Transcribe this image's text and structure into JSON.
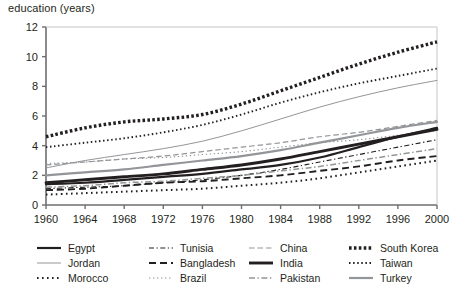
{
  "axis": {
    "ylabel": "education (years)",
    "yticks": [
      "0",
      "2",
      "4",
      "6",
      "8",
      "10",
      "12"
    ],
    "xticks": [
      "1960",
      "1964",
      "1968",
      "1972",
      "1976",
      "1980",
      "1984",
      "1988",
      "1992",
      "1996",
      "2000"
    ]
  },
  "legend": {
    "columns": [
      [
        {
          "name": "Egypt",
          "style": "solid-bold",
          "color": "#231f20"
        },
        {
          "name": "Jordan",
          "style": "solid-thin",
          "color": "#808285"
        },
        {
          "name": "Morocco",
          "style": "dotted-bold",
          "color": "#231f20"
        }
      ],
      [
        {
          "name": "Tunisia",
          "style": "dash-dot-thin",
          "color": "#231f20"
        },
        {
          "name": "Bangladesh",
          "style": "dashed-bold",
          "color": "#231f20"
        },
        {
          "name": "Brazil",
          "style": "dotted-thin",
          "color": "#808285"
        }
      ],
      [
        {
          "name": "China",
          "style": "dashed-thin",
          "color": "#808285"
        },
        {
          "name": "India",
          "style": "solid-extrabold",
          "color": "#231f20"
        },
        {
          "name": "Pakistan",
          "style": "dash-dot-grey",
          "color": "#808285"
        }
      ],
      [
        {
          "name": "South Korea",
          "style": "dotted-extrabold",
          "color": "#231f20"
        },
        {
          "name": "Taiwan",
          "style": "dotted-small",
          "color": "#231f20"
        },
        {
          "name": "Turkey",
          "style": "solid-grey-bold",
          "color": "#808285"
        }
      ]
    ]
  },
  "chart_data": {
    "type": "line",
    "title": "",
    "xlabel": "",
    "ylabel": "education (years)",
    "xlim": [
      1960,
      2000
    ],
    "ylim": [
      0,
      12
    ],
    "grid": false,
    "legend_position": "bottom",
    "x": [
      1960,
      1964,
      1968,
      1972,
      1976,
      1980,
      1984,
      1988,
      1992,
      1996,
      2000
    ],
    "series": [
      {
        "name": "Egypt",
        "values": [
          1.4,
          1.5,
          1.7,
          1.9,
          2.1,
          2.4,
          2.7,
          3.2,
          3.9,
          4.6,
          5.2
        ]
      },
      {
        "name": "Jordan",
        "values": [
          2.5,
          3.0,
          3.4,
          3.8,
          4.3,
          5.0,
          5.8,
          6.6,
          7.3,
          7.9,
          8.4
        ]
      },
      {
        "name": "Morocco",
        "values": [
          0.7,
          0.8,
          0.9,
          1.0,
          1.1,
          1.3,
          1.5,
          1.8,
          2.2,
          2.6,
          3.0
        ]
      },
      {
        "name": "Tunisia",
        "values": [
          1.1,
          1.2,
          1.3,
          1.5,
          1.7,
          2.0,
          2.4,
          2.9,
          3.4,
          3.9,
          4.4
        ]
      },
      {
        "name": "Bangladesh",
        "values": [
          1.0,
          1.1,
          1.3,
          1.5,
          1.6,
          1.8,
          2.0,
          2.3,
          2.6,
          3.0,
          3.3
        ]
      },
      {
        "name": "Brazil",
        "values": [
          2.8,
          2.9,
          3.1,
          3.2,
          3.4,
          3.6,
          3.9,
          4.2,
          4.4,
          4.7,
          5.0
        ]
      },
      {
        "name": "China",
        "values": [
          2.7,
          2.9,
          3.1,
          3.3,
          3.6,
          3.9,
          4.2,
          4.6,
          4.9,
          5.3,
          5.7
        ]
      },
      {
        "name": "India",
        "values": [
          1.5,
          1.7,
          1.9,
          2.1,
          2.4,
          2.7,
          3.1,
          3.6,
          4.1,
          4.6,
          5.1
        ]
      },
      {
        "name": "Pakistan",
        "values": [
          1.2,
          1.3,
          1.5,
          1.6,
          1.8,
          2.0,
          2.3,
          2.6,
          3.0,
          3.4,
          3.8
        ]
      },
      {
        "name": "South Korea",
        "values": [
          4.6,
          5.2,
          5.6,
          5.8,
          6.1,
          6.8,
          7.7,
          8.6,
          9.5,
          10.3,
          11.0
        ]
      },
      {
        "name": "Taiwan",
        "values": [
          3.9,
          4.2,
          4.5,
          4.9,
          5.4,
          6.1,
          6.9,
          7.6,
          8.2,
          8.7,
          9.2
        ]
      },
      {
        "name": "Turkey",
        "values": [
          2.0,
          2.2,
          2.4,
          2.7,
          3.0,
          3.3,
          3.7,
          4.2,
          4.7,
          5.2,
          5.6
        ]
      }
    ]
  }
}
